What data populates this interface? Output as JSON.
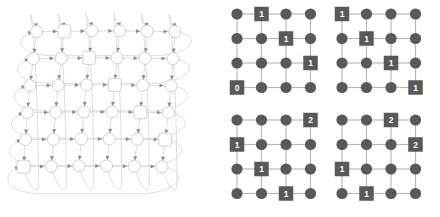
{
  "figure": {
    "background_color": "#ffffff"
  },
  "colors": {
    "torus_node_stroke": "#c9c9c9",
    "torus_node_fill": "#ffffff",
    "torus_edge": "#cfcfcf",
    "torus_arrow": "#8e8e8e",
    "grid_node_fill": "#595959",
    "grid_edge": "#b9b9b9",
    "grid_label_text": "#ffffff"
  },
  "torus_panel": {
    "name": "torus-network-diagram",
    "rows": 6,
    "cols": 6,
    "node_shape_default": "circle",
    "square_nodes": [
      {
        "row": 0,
        "col": 1
      },
      {
        "row": 1,
        "col": 2
      },
      {
        "row": 2,
        "col": 3
      },
      {
        "row": 3,
        "col": 4
      },
      {
        "row": 4,
        "col": 5
      },
      {
        "row": 5,
        "col": 0
      }
    ],
    "wrap_around": true,
    "directed": true
  },
  "grids_panel": {
    "name": "grid-configurations",
    "grid_rows": 4,
    "grid_cols": 4,
    "grids": [
      {
        "name": "grid-top-left",
        "position": "top-left",
        "labels": [
          {
            "row": 0,
            "col": 1,
            "value": "1"
          },
          {
            "row": 1,
            "col": 2,
            "value": "1"
          },
          {
            "row": 2,
            "col": 3,
            "value": "1"
          },
          {
            "row": 3,
            "col": 0,
            "value": "0"
          }
        ]
      },
      {
        "name": "grid-top-right",
        "position": "top-right",
        "labels": [
          {
            "row": 0,
            "col": 0,
            "value": "1"
          },
          {
            "row": 1,
            "col": 1,
            "value": "1"
          },
          {
            "row": 2,
            "col": 2,
            "value": "1"
          },
          {
            "row": 3,
            "col": 3,
            "value": "1"
          }
        ]
      },
      {
        "name": "grid-bottom-left",
        "position": "bottom-left",
        "labels": [
          {
            "row": 0,
            "col": 3,
            "value": "2"
          },
          {
            "row": 1,
            "col": 0,
            "value": "1"
          },
          {
            "row": 2,
            "col": 1,
            "value": "1"
          },
          {
            "row": 3,
            "col": 2,
            "value": "1"
          }
        ]
      },
      {
        "name": "grid-bottom-right",
        "position": "bottom-right",
        "labels": [
          {
            "row": 0,
            "col": 2,
            "value": "2"
          },
          {
            "row": 1,
            "col": 3,
            "value": "2"
          },
          {
            "row": 2,
            "col": 0,
            "value": "1"
          },
          {
            "row": 3,
            "col": 1,
            "value": "1"
          }
        ]
      }
    ]
  }
}
